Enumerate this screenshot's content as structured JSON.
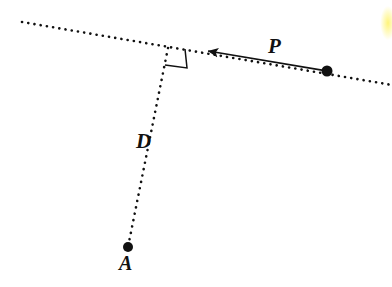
{
  "figure": {
    "background_color": "#ffffff",
    "ink_color": "#111111",
    "width": 392,
    "height": 287
  },
  "labels": {
    "p": "P",
    "d": "D",
    "a": "A"
  },
  "annotations": {
    "right_angle": "right-angle-marker",
    "arrow": "leftward-arrow"
  },
  "highlight": {
    "color": "#fff36e"
  },
  "chart_data": {
    "type": "scatter",
    "xlabel": "",
    "ylabel": "",
    "xlim": [
      0,
      392
    ],
    "ylim": [
      287,
      0
    ],
    "grid": false,
    "legend": null,
    "points": [
      {
        "name": "P",
        "label": "P",
        "x": 327,
        "y": 71,
        "marker": "filled-circle",
        "radius": 5.5
      },
      {
        "name": "A",
        "label": "A",
        "x": 128,
        "y": 247,
        "marker": "filled-circle",
        "radius": 5.0
      },
      {
        "name": "foot",
        "label": "",
        "x": 168,
        "y": 48,
        "marker": "none",
        "radius": 0
      }
    ],
    "lines": [
      {
        "name": "mirror-line",
        "style": "dotted",
        "x1": 22,
        "y1": 22,
        "x2": 392,
        "y2": 85,
        "width": 2.6
      },
      {
        "name": "perpendicular-segment",
        "style": "dotted",
        "x1": 168,
        "y1": 48,
        "x2": 128,
        "y2": 247,
        "width": 2.6,
        "label": "D"
      },
      {
        "name": "displacement-arrow",
        "style": "solid-arrow",
        "x1": 327,
        "y1": 71,
        "x2": 214,
        "y2": 52,
        "width": 1.6,
        "label": "P"
      }
    ],
    "markers": [
      {
        "name": "right-angle",
        "vertex_x": 168,
        "vertex_y": 48,
        "corner_x": 187,
        "corner_y": 68,
        "arm1_x": 185,
        "arm1_y": 49,
        "arm2_x": 165,
        "arm2_y": 65
      }
    ]
  }
}
